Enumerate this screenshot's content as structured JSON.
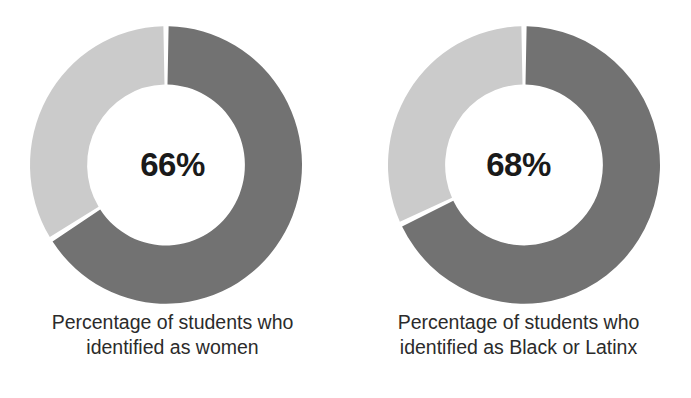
{
  "figure": {
    "cropped_top_line": "",
    "colors": {
      "segment_filled": "#727272",
      "segment_remainder": "#cbcbcb",
      "value_text": "#1a1a1a",
      "caption_text": "#2b2b2b",
      "background": "#ffffff",
      "gap": "#ffffff"
    }
  },
  "chart_data": [
    {
      "type": "pie",
      "variant": "donut",
      "title": "Percentage of students who identified as women",
      "center_label": "66%",
      "categories": [
        "Identified as women",
        "Did not identify as women"
      ],
      "values": [
        66,
        34
      ],
      "units": "percent",
      "start_angle_deg": 0,
      "direction": "clockwise",
      "hole_ratio": 0.58,
      "legend": "none",
      "grid": false,
      "caption_lines": [
        "Percentage of students who",
        "identified as women"
      ]
    },
    {
      "type": "pie",
      "variant": "donut",
      "title": "Percentage of students who identified as Black or Latinx",
      "center_label": "68%",
      "categories": [
        "Identified as Black or Latinx",
        "Did not identify as Black or Latinx"
      ],
      "values": [
        68,
        32
      ],
      "units": "percent",
      "start_angle_deg": 0,
      "direction": "clockwise",
      "hole_ratio": 0.58,
      "legend": "none",
      "grid": false,
      "caption_lines": [
        "Percentage of students who",
        "identified as Black or Latinx"
      ]
    }
  ]
}
